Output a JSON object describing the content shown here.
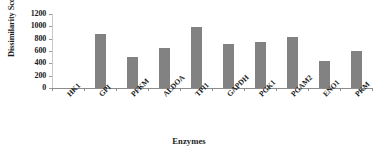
{
  "chart_data": {
    "type": "bar",
    "title": "",
    "xlabel": "Enzymes",
    "ylabel": "Dissimilarity Score",
    "categories": [
      "HK1",
      "GPI",
      "PFKM",
      "ALDOA",
      "TPI1",
      "GAPDH",
      "PGK1",
      "PGAM2",
      "ENO1",
      "PKM"
    ],
    "values": [
      0,
      880,
      510,
      645,
      985,
      710,
      740,
      830,
      440,
      595
    ],
    "series": [
      {
        "name": "Dissimilarity Score",
        "values": [
          0,
          880,
          510,
          645,
          985,
          710,
          740,
          830,
          440,
          595
        ]
      }
    ],
    "ylim": [
      0,
      1200
    ],
    "y_ticks": [
      0,
      200,
      400,
      600,
      800,
      1000,
      1200
    ],
    "y_tick_labels": [
      "0",
      "200",
      "400",
      "600",
      "800",
      "1000",
      "1200"
    ],
    "grid": false,
    "legend": false,
    "legend_position": "none",
    "bar_color": "#828282",
    "axis_color": "#8c8c8c",
    "text_color": "#1a1a1a",
    "background_color": "#ffffff"
  }
}
